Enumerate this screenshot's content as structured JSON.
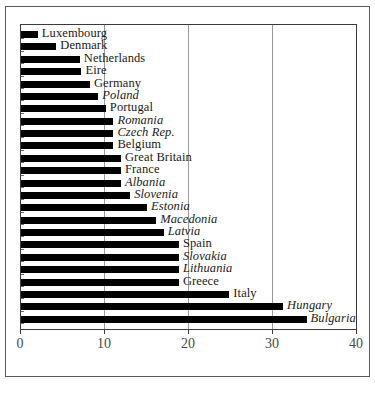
{
  "chart_data": {
    "type": "bar",
    "orientation": "horizontal",
    "title": "",
    "subtitle": "",
    "xlabel": "",
    "ylabel": "",
    "xlim": [
      0,
      40
    ],
    "ylim": null,
    "grid": true,
    "gridlines_x": [
      10,
      20,
      30
    ],
    "legend": null,
    "legend_position": "none",
    "xticks": [
      0,
      10,
      20,
      30,
      40
    ],
    "xtick_labels": [
      "0",
      "10",
      "20",
      "30",
      "40"
    ],
    "categories": [
      "Luxembourg",
      "Denmark",
      "Netherlands",
      "Eire",
      "Germany",
      "Poland",
      "Portugal",
      "Romania",
      "Czech Rep.",
      "Belgium",
      "Great Britain",
      "France",
      "Albania",
      "Slovenia",
      "Estonia",
      "Macedonia",
      "Latvia",
      "Spain",
      "Slovakia",
      "Lithuania",
      "Greece",
      "Italy",
      "Hungary",
      "Bulgaria"
    ],
    "values": [
      2.0,
      4.2,
      7.0,
      7.2,
      8.2,
      9.2,
      10.1,
      11.0,
      11.0,
      11.0,
      11.9,
      11.9,
      11.9,
      13.0,
      15.0,
      16.1,
      17.0,
      18.8,
      18.8,
      18.8,
      18.8,
      24.8,
      31.2,
      34.0
    ],
    "label_styles": [
      "normal",
      "normal",
      "normal",
      "normal",
      "normal",
      "italic",
      "normal",
      "italic",
      "italic",
      "normal",
      "normal",
      "normal",
      "italic",
      "italic",
      "italic",
      "italic",
      "italic",
      "normal",
      "italic",
      "italic",
      "normal",
      "normal",
      "italic",
      "italic"
    ],
    "bar_color": "#000000",
    "grid_color": "#9a9a9a",
    "axis_color": "#3a3a3a",
    "background_color": "#ffffff"
  }
}
